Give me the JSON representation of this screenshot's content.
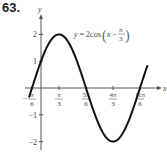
{
  "problem_number": "63.",
  "chart_data": {
    "type": "line",
    "title": "",
    "equation_label": "y = 2cos(x − π/3)",
    "xlabel": "x",
    "ylabel": "y",
    "x_ticks": [
      "−π/6",
      "π/3",
      "5π/6",
      "4π/3",
      "11π/6"
    ],
    "x_tick_values": [
      -0.5236,
      1.0472,
      2.618,
      4.1888,
      5.7596
    ],
    "y_ticks": [
      "2",
      "1",
      "−1",
      "−2"
    ],
    "y_tick_values": [
      2,
      1,
      -1,
      -2
    ],
    "ylim": [
      -2.3,
      2.5
    ],
    "xlim": [
      -0.7,
      6.2
    ],
    "grid": false,
    "series": [
      {
        "name": "y = 2cos(x − π/3)",
        "function": "2*cos(x - pi/3)",
        "x_range": [
          -0.7,
          6.2
        ]
      }
    ],
    "key_points": [
      {
        "x": "−π/6",
        "y": 0
      },
      {
        "x": "π/3",
        "y": 2
      },
      {
        "x": "5π/6",
        "y": 0
      },
      {
        "x": "4π/3",
        "y": -2
      },
      {
        "x": "11π/6",
        "y": 0
      }
    ]
  }
}
